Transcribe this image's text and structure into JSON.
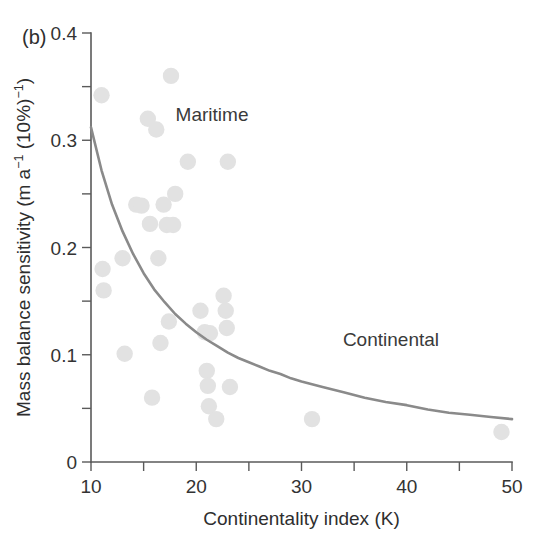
{
  "panel": {
    "label": "(b)"
  },
  "chart_data": {
    "type": "scatter",
    "title": "",
    "xlabel": "Continentality index (K)",
    "ylabel": "Mass balance sensitivity (m a−1 (10%)−1)",
    "ylabel_parts": {
      "base1": "Mass balance sensitivity (m a",
      "sup1": "−1",
      "base2": " (10%)",
      "sup2": "−1",
      "base3": ")"
    },
    "xlim": [
      10,
      50
    ],
    "ylim": [
      0,
      0.4
    ],
    "xticks": [
      10,
      20,
      30,
      40,
      50
    ],
    "xtick_labels": [
      "10",
      "20",
      "30",
      "40",
      "50"
    ],
    "xticks_minor": [
      15,
      25,
      35,
      45
    ],
    "yticks": [
      0,
      0.1,
      0.2,
      0.3,
      0.4
    ],
    "ytick_labels": [
      "0",
      "0.1",
      "0.2",
      "0.3",
      "0.4"
    ],
    "yticks_minor": [
      0.05,
      0.15,
      0.25,
      0.35
    ],
    "grid": false,
    "legend": "none",
    "marker_color": "#e2e2e2",
    "curve_color": "#8a8a8a",
    "axis_color": "#5a5a5a",
    "annotations": [
      {
        "text": "Maritime",
        "x": 21.5,
        "y": 0.318
      },
      {
        "text": "Continental",
        "x": 38.5,
        "y": 0.108
      }
    ],
    "series": [
      {
        "name": "Glaciers",
        "marker": "circle",
        "points": [
          [
            11.0,
            0.342
          ],
          [
            11.1,
            0.18
          ],
          [
            11.2,
            0.16
          ],
          [
            13.0,
            0.19
          ],
          [
            13.2,
            0.101
          ],
          [
            14.3,
            0.24
          ],
          [
            14.8,
            0.239
          ],
          [
            15.4,
            0.32
          ],
          [
            15.6,
            0.222
          ],
          [
            15.8,
            0.06
          ],
          [
            16.2,
            0.31
          ],
          [
            16.4,
            0.19
          ],
          [
            16.6,
            0.111
          ],
          [
            16.9,
            0.24
          ],
          [
            17.2,
            0.221
          ],
          [
            17.4,
            0.131
          ],
          [
            17.6,
            0.36
          ],
          [
            17.8,
            0.221
          ],
          [
            18.0,
            0.25
          ],
          [
            19.2,
            0.28
          ],
          [
            20.4,
            0.141
          ],
          [
            20.8,
            0.121
          ],
          [
            21.0,
            0.085
          ],
          [
            21.1,
            0.071
          ],
          [
            21.2,
            0.052
          ],
          [
            21.3,
            0.12
          ],
          [
            21.9,
            0.04
          ],
          [
            22.6,
            0.155
          ],
          [
            22.8,
            0.141
          ],
          [
            22.9,
            0.125
          ],
          [
            23.0,
            0.28
          ],
          [
            23.2,
            0.07
          ],
          [
            31.0,
            0.04
          ],
          [
            49.0,
            0.028
          ]
        ]
      }
    ],
    "fit_curve": {
      "name": "Exponential fit",
      "x_start": 10.0,
      "y_start": 0.312,
      "x_end": 50.0,
      "y_end": 0.04,
      "points": [
        [
          10.0,
          0.312
        ],
        [
          11.0,
          0.272
        ],
        [
          12.0,
          0.24
        ],
        [
          13.0,
          0.215
        ],
        [
          14.0,
          0.194
        ],
        [
          15.0,
          0.176
        ],
        [
          16.0,
          0.161
        ],
        [
          17.0,
          0.149
        ],
        [
          18.0,
          0.138
        ],
        [
          19.0,
          0.129
        ],
        [
          20.0,
          0.121
        ],
        [
          21.0,
          0.114
        ],
        [
          22.0,
          0.108
        ],
        [
          23.0,
          0.102
        ],
        [
          24.0,
          0.097
        ],
        [
          25.0,
          0.093
        ],
        [
          26.0,
          0.089
        ],
        [
          27.0,
          0.085
        ],
        [
          28.0,
          0.082
        ],
        [
          29.0,
          0.078
        ],
        [
          30.0,
          0.075
        ],
        [
          32.0,
          0.07
        ],
        [
          34.0,
          0.065
        ],
        [
          36.0,
          0.06
        ],
        [
          38.0,
          0.056
        ],
        [
          40.0,
          0.053
        ],
        [
          42.0,
          0.049
        ],
        [
          44.0,
          0.046
        ],
        [
          46.0,
          0.044
        ],
        [
          48.0,
          0.042
        ],
        [
          50.0,
          0.04
        ]
      ]
    }
  }
}
